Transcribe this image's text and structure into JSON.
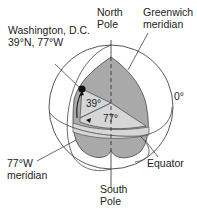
{
  "labels": {
    "washington_line1": "Washington, D.C.",
    "washington_line2": "39°N, 77°W",
    "north_pole_line1": "North",
    "north_pole_line2": "Pole",
    "greenwich_line1": "Greenwich",
    "greenwich_line2": "meridian",
    "zero_degree": "0°",
    "lat_angle": "39°",
    "lon_angle": "77°",
    "meridian77_line1": "77°W",
    "meridian77_line2": "meridian",
    "equator": "Equator",
    "south_pole_line1": "South",
    "south_pole_line2": "Pole"
  },
  "colors": {
    "wedge_fill": "#a9a9a9",
    "band_fill": "#d6d6d6",
    "line": "#333333",
    "dot": "#111111"
  }
}
